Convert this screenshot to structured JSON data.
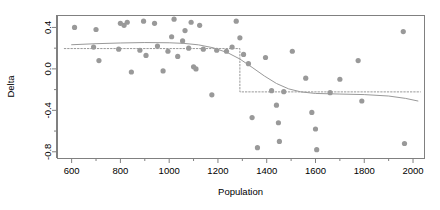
{
  "chart_data": {
    "type": "scatter",
    "title": "",
    "xlabel": "Population",
    "ylabel": "Delta",
    "xlim": [
      540,
      2045
    ],
    "ylim": [
      -0.86,
      0.52
    ],
    "grid": false,
    "legend": null,
    "x_ticks": [
      600,
      800,
      1000,
      1200,
      1400,
      1600,
      1800,
      2000
    ],
    "x_tick_labels": [
      "600",
      "800",
      "1000",
      "1200",
      "1400",
      "1600",
      "1800",
      "2000"
    ],
    "x_minor_ticks": [
      700,
      900,
      1100,
      1300,
      1500,
      1700,
      1900
    ],
    "y_ticks": [
      0.4,
      0.0,
      -0.4,
      -0.8
    ],
    "y_tick_labels": [
      "0.4",
      "0.0",
      "-0.4",
      "-0.8"
    ],
    "y_minor_ticks": [
      0.2,
      -0.2,
      -0.6
    ],
    "point_color": "#999999",
    "line_color": "#999999",
    "axis_color": "#808080",
    "points": [
      {
        "x": 612,
        "y": 0.4
      },
      {
        "x": 690,
        "y": 0.21
      },
      {
        "x": 700,
        "y": 0.38
      },
      {
        "x": 712,
        "y": 0.08
      },
      {
        "x": 793,
        "y": 0.19
      },
      {
        "x": 800,
        "y": 0.44
      },
      {
        "x": 815,
        "y": 0.42
      },
      {
        "x": 828,
        "y": 0.45
      },
      {
        "x": 845,
        "y": -0.03
      },
      {
        "x": 880,
        "y": 0.18
      },
      {
        "x": 895,
        "y": 0.46
      },
      {
        "x": 905,
        "y": 0.13
      },
      {
        "x": 940,
        "y": 0.44
      },
      {
        "x": 952,
        "y": 0.22
      },
      {
        "x": 975,
        "y": -0.02
      },
      {
        "x": 995,
        "y": 0.17
      },
      {
        "x": 1010,
        "y": 0.31
      },
      {
        "x": 1020,
        "y": 0.48
      },
      {
        "x": 1035,
        "y": 0.12
      },
      {
        "x": 1055,
        "y": 0.27
      },
      {
        "x": 1065,
        "y": 0.37
      },
      {
        "x": 1080,
        "y": 0.2
      },
      {
        "x": 1090,
        "y": 0.45
      },
      {
        "x": 1100,
        "y": 0.02
      },
      {
        "x": 1110,
        "y": 0.0
      },
      {
        "x": 1125,
        "y": 0.42
      },
      {
        "x": 1140,
        "y": 0.19
      },
      {
        "x": 1175,
        "y": -0.25
      },
      {
        "x": 1195,
        "y": 0.18
      },
      {
        "x": 1235,
        "y": 0.17
      },
      {
        "x": 1258,
        "y": 0.21
      },
      {
        "x": 1275,
        "y": 0.46
      },
      {
        "x": 1290,
        "y": 0.3
      },
      {
        "x": 1305,
        "y": 0.14
      },
      {
        "x": 1325,
        "y": 0.05
      },
      {
        "x": 1340,
        "y": -0.47
      },
      {
        "x": 1362,
        "y": -0.76
      },
      {
        "x": 1395,
        "y": 0.11
      },
      {
        "x": 1420,
        "y": -0.21
      },
      {
        "x": 1440,
        "y": -0.35
      },
      {
        "x": 1448,
        "y": -0.52
      },
      {
        "x": 1452,
        "y": -0.7
      },
      {
        "x": 1470,
        "y": -0.22
      },
      {
        "x": 1505,
        "y": 0.17
      },
      {
        "x": 1560,
        "y": -0.09
      },
      {
        "x": 1585,
        "y": -0.42
      },
      {
        "x": 1600,
        "y": -0.58
      },
      {
        "x": 1605,
        "y": -0.78
      },
      {
        "x": 1660,
        "y": -0.23
      },
      {
        "x": 1700,
        "y": -0.1
      },
      {
        "x": 1775,
        "y": 0.08
      },
      {
        "x": 1790,
        "y": -0.31
      },
      {
        "x": 1960,
        "y": 0.36
      },
      {
        "x": 1965,
        "y": -0.72
      }
    ],
    "series": [
      {
        "name": "smooth-fit",
        "style": "solid",
        "color": "#999999",
        "points": [
          {
            "x": 600,
            "y": 0.233
          },
          {
            "x": 700,
            "y": 0.243
          },
          {
            "x": 800,
            "y": 0.25
          },
          {
            "x": 900,
            "y": 0.254
          },
          {
            "x": 1000,
            "y": 0.252
          },
          {
            "x": 1060,
            "y": 0.246
          },
          {
            "x": 1120,
            "y": 0.232
          },
          {
            "x": 1180,
            "y": 0.204
          },
          {
            "x": 1240,
            "y": 0.156
          },
          {
            "x": 1290,
            "y": 0.095
          },
          {
            "x": 1340,
            "y": 0.015
          },
          {
            "x": 1390,
            "y": -0.068
          },
          {
            "x": 1440,
            "y": -0.141
          },
          {
            "x": 1490,
            "y": -0.193
          },
          {
            "x": 1540,
            "y": -0.222
          },
          {
            "x": 1600,
            "y": -0.237
          },
          {
            "x": 1700,
            "y": -0.243
          },
          {
            "x": 1800,
            "y": -0.248
          },
          {
            "x": 1900,
            "y": -0.262
          },
          {
            "x": 1970,
            "y": -0.285
          },
          {
            "x": 2020,
            "y": -0.31
          }
        ]
      },
      {
        "name": "step-fit",
        "style": "dotted",
        "color": "#999999",
        "points": [
          {
            "x": 570,
            "y": 0.196
          },
          {
            "x": 1290,
            "y": 0.196
          },
          {
            "x": 1290,
            "y": -0.222
          },
          {
            "x": 2030,
            "y": -0.222
          }
        ]
      }
    ]
  },
  "plot": {
    "frame": {
      "left": 57,
      "top": 15,
      "right": 424,
      "bottom": 158
    }
  }
}
